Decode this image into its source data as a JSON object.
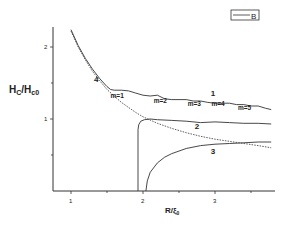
{
  "chart_data": {
    "type": "line",
    "title": "",
    "xlabel": "R/ξ₀",
    "ylabel": "Hc/Hc0",
    "xlim": [
      0.75,
      3.78
    ],
    "ylim": [
      0,
      2.4
    ],
    "x_ticks": [
      1,
      2,
      3
    ],
    "x_minor_ticks": [
      1.5,
      2.5,
      3.5
    ],
    "y_ticks": [
      1,
      2
    ],
    "y_minor_ticks": [
      0.5,
      1.5
    ],
    "grid": false,
    "legend": {
      "position": "top-right",
      "entries": [
        "B"
      ]
    },
    "series": [
      {
        "name": "1",
        "style": "solid",
        "x": [
          1.0,
          1.1,
          1.2,
          1.3,
          1.4,
          1.5,
          1.55,
          1.6,
          1.7,
          1.8,
          1.9,
          2.0,
          2.1,
          2.2,
          2.3,
          2.4,
          2.5,
          2.6,
          2.7,
          2.8,
          2.9,
          3.0,
          3.1,
          3.2,
          3.3,
          3.4,
          3.5,
          3.6,
          3.7,
          3.78
        ],
        "y": [
          2.24,
          2.02,
          1.84,
          1.69,
          1.56,
          1.45,
          1.41,
          1.4,
          1.4,
          1.39,
          1.36,
          1.33,
          1.32,
          1.33,
          1.28,
          1.27,
          1.27,
          1.27,
          1.25,
          1.25,
          1.23,
          1.22,
          1.22,
          1.22,
          1.2,
          1.2,
          1.18,
          1.18,
          1.15,
          1.13
        ]
      },
      {
        "name": "2",
        "style": "solid",
        "x": [
          1.93,
          1.93,
          1.94,
          1.97,
          2.02,
          2.1,
          2.2,
          2.4,
          2.6,
          2.8,
          3.0,
          3.2,
          3.4,
          3.6,
          3.78
        ],
        "y": [
          0.0,
          0.85,
          0.92,
          0.97,
          0.99,
          1.0,
          0.99,
          0.98,
          0.97,
          0.95,
          0.96,
          0.95,
          0.94,
          0.94,
          0.93
        ]
      },
      {
        "name": "3",
        "style": "solid",
        "x": [
          2.04,
          2.06,
          2.1,
          2.2,
          2.3,
          2.4,
          2.6,
          2.8,
          3.0,
          3.2,
          3.4,
          3.6,
          3.78
        ],
        "y": [
          0.0,
          0.14,
          0.26,
          0.39,
          0.47,
          0.52,
          0.59,
          0.63,
          0.65,
          0.66,
          0.67,
          0.68,
          0.68
        ]
      },
      {
        "name": "4",
        "style": "dotted",
        "x": [
          1.0,
          1.1,
          1.2,
          1.3,
          1.4,
          1.5,
          1.6,
          1.7,
          1.8,
          1.9,
          2.0,
          2.2,
          2.4,
          2.6,
          2.8,
          3.0,
          3.2,
          3.4,
          3.6,
          3.78
        ],
        "y": [
          2.22,
          2.0,
          1.82,
          1.66,
          1.53,
          1.41,
          1.32,
          1.23,
          1.16,
          1.09,
          1.03,
          0.94,
          0.87,
          0.81,
          0.76,
          0.72,
          0.69,
          0.66,
          0.63,
          0.6
        ]
      }
    ],
    "annotations": [
      {
        "text": "1",
        "x": 2.94,
        "y": 1.32
      },
      {
        "text": "2",
        "x": 2.72,
        "y": 0.86
      },
      {
        "text": "3",
        "x": 2.94,
        "y": 0.52
      },
      {
        "text": "4",
        "x": 1.32,
        "y": 1.52
      },
      {
        "text": "m=1",
        "x": 1.55,
        "y": 1.29
      },
      {
        "text": "m=2",
        "x": 2.15,
        "y": 1.22
      },
      {
        "text": "m=3",
        "x": 2.62,
        "y": 1.18
      },
      {
        "text": "m=4",
        "x": 2.95,
        "y": 1.18
      },
      {
        "text": "m=5",
        "x": 3.32,
        "y": 1.12
      }
    ]
  }
}
